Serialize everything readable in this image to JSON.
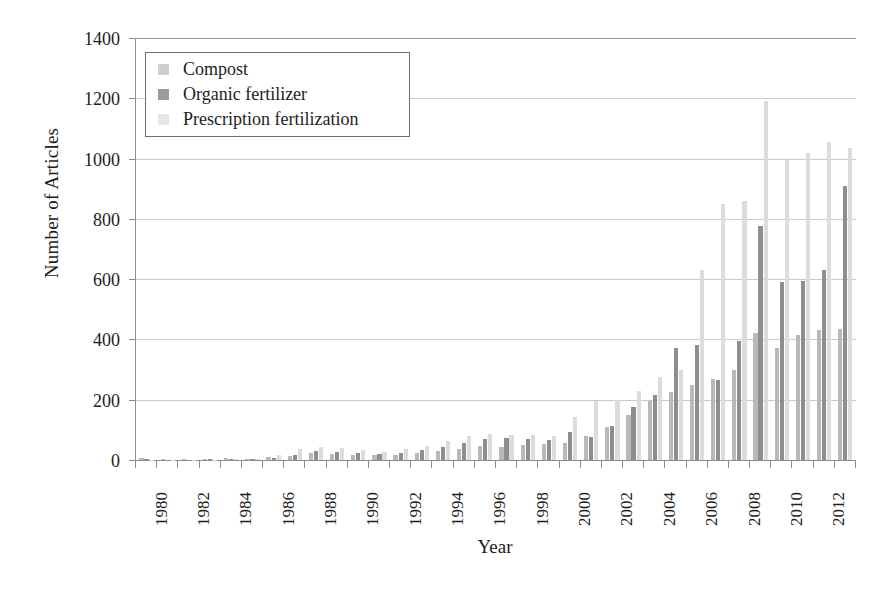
{
  "chart_data": {
    "type": "bar",
    "title": "",
    "xlabel": "Year",
    "ylabel": "Number of Articles",
    "ylim": [
      0,
      1400
    ],
    "ytick_step": 200,
    "yticks": [
      0,
      200,
      400,
      600,
      800,
      1000,
      1200,
      1400
    ],
    "grid": true,
    "legend_position": "top-left",
    "categories": [
      "1980",
      "1981",
      "1982",
      "1983",
      "1984",
      "1985",
      "1986",
      "1987",
      "1988",
      "1989",
      "1990",
      "1991",
      "1992",
      "1993",
      "1994",
      "1995",
      "1996",
      "1997",
      "1998",
      "1999",
      "2000",
      "2001",
      "2002",
      "2003",
      "2004",
      "2005",
      "2006",
      "2007",
      "2008",
      "2009",
      "2010",
      "2011",
      "2012",
      "2013"
    ],
    "xtick_labels": [
      "1980",
      "1982",
      "1984",
      "1986",
      "1988",
      "1990",
      "1992",
      "1994",
      "1996",
      "1998",
      "2000",
      "2002",
      "2004",
      "2006",
      "2008",
      "2010",
      "2012"
    ],
    "series": [
      {
        "name": "Compost",
        "color": "#b9b9b9",
        "values": [
          6,
          3,
          2,
          4,
          8,
          5,
          9,
          12,
          22,
          20,
          18,
          16,
          18,
          22,
          30,
          38,
          46,
          44,
          50,
          52,
          58,
          80,
          110,
          150,
          195,
          225,
          250,
          270,
          300,
          420,
          370,
          415,
          430,
          435
        ]
      },
      {
        "name": "Organic fertilizer",
        "color": "#8e8e8e",
        "values": [
          2,
          1,
          1,
          2,
          3,
          4,
          6,
          18,
          30,
          26,
          22,
          20,
          24,
          34,
          44,
          55,
          70,
          72,
          70,
          68,
          92,
          78,
          112,
          175,
          215,
          370,
          380,
          265,
          395,
          775,
          590,
          595,
          630,
          910
        ]
      },
      {
        "name": "Prescription fertilization",
        "color": "#dcdcdc",
        "values": [
          1,
          1,
          1,
          1,
          2,
          2,
          18,
          35,
          44,
          40,
          32,
          28,
          36,
          48,
          62,
          80,
          86,
          84,
          82,
          80,
          142,
          196,
          200,
          230,
          275,
          300,
          630,
          850,
          860,
          1190,
          995,
          1020,
          1055,
          1035
        ]
      }
    ]
  },
  "axes": {
    "y_title": "Number of Articles",
    "x_title": "Year"
  },
  "legend": {
    "items": [
      {
        "label": "Compost",
        "swatch": "legend-swatch-compost"
      },
      {
        "label": "Organic fertilizer",
        "swatch": "legend-swatch-organic-fertilizer"
      },
      {
        "label": "Prescription fertilization",
        "swatch": "legend-swatch-prescription-fertilization"
      }
    ]
  }
}
